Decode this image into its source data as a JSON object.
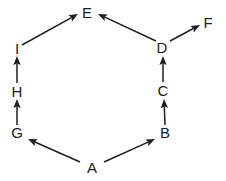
{
  "diagram": {
    "type": "directed-graph",
    "background_color": "#ffffff",
    "stroke_color": "#1f1f1f",
    "label_color": "#1b1b1b",
    "width": 226,
    "height": 181,
    "nodes": [
      {
        "id": "E",
        "label": "E",
        "x": 87,
        "y": 12
      },
      {
        "id": "F",
        "label": "F",
        "x": 208,
        "y": 22
      },
      {
        "id": "I",
        "label": "I",
        "x": 17,
        "y": 48
      },
      {
        "id": "D",
        "label": "D",
        "x": 162,
        "y": 47
      },
      {
        "id": "H",
        "label": "H",
        "x": 17,
        "y": 91
      },
      {
        "id": "C",
        "label": "C",
        "x": 163,
        "y": 90
      },
      {
        "id": "G",
        "label": "G",
        "x": 17,
        "y": 132
      },
      {
        "id": "B",
        "label": "B",
        "x": 165,
        "y": 132
      },
      {
        "id": "A",
        "label": "A",
        "x": 92,
        "y": 167
      }
    ],
    "edges": [
      {
        "from": "A",
        "to": "G",
        "x1": 80,
        "y1": 162,
        "x2": 28,
        "y2": 139
      },
      {
        "from": "A",
        "to": "B",
        "x1": 104,
        "y1": 162,
        "x2": 155,
        "y2": 139
      },
      {
        "from": "G",
        "to": "H",
        "x1": 17,
        "y1": 125,
        "x2": 17,
        "y2": 99
      },
      {
        "from": "H",
        "to": "I",
        "x1": 17,
        "y1": 83,
        "x2": 17,
        "y2": 56
      },
      {
        "from": "I",
        "to": "E",
        "x1": 22,
        "y1": 45,
        "x2": 78,
        "y2": 14
      },
      {
        "from": "B",
        "to": "C",
        "x1": 165,
        "y1": 125,
        "x2": 164,
        "y2": 99
      },
      {
        "from": "C",
        "to": "D",
        "x1": 163,
        "y1": 82,
        "x2": 163,
        "y2": 56
      },
      {
        "from": "D",
        "to": "E",
        "x1": 156,
        "y1": 41,
        "x2": 98,
        "y2": 14
      },
      {
        "from": "D",
        "to": "F",
        "x1": 170,
        "y1": 41,
        "x2": 200,
        "y2": 25
      }
    ]
  }
}
